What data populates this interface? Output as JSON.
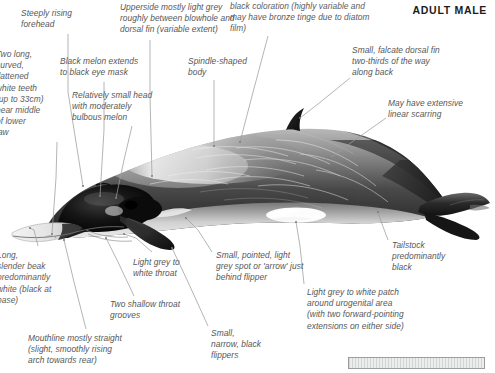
{
  "header": {
    "title": "ADULT MALE"
  },
  "figure": {
    "orientation": "left-facing",
    "colors": {
      "body_dark": "#242424",
      "body_mid": "#6b6b6b",
      "body_light": "#dedede",
      "belly_white": "#fbfbfb",
      "leader_line": "#9a9c9e",
      "text": "#555759",
      "header_text": "#1c1c1c",
      "scalebar_fill": "#eceded",
      "scalebar_border": "#9a9c9e"
    }
  },
  "callouts": [
    {
      "id": "steeply-rising-forehead",
      "text": "Steeply rising\nforehead",
      "x": 21,
      "y": 8,
      "align": "left",
      "clipped": false
    },
    {
      "id": "upperside-light-grey",
      "text": "Upperside mostly light grey\nroughly between blowhole and\ndorsal fin (variable extent)",
      "x": 120,
      "y": 2,
      "align": "left",
      "clipped": false
    },
    {
      "id": "black-coloration-bronze-tinge",
      "text": "black coloration (highly variable and\nmay have bronze tinge due to diatom\nfilm)",
      "x": 230,
      "y": 1,
      "align": "left",
      "clipped": true
    },
    {
      "id": "two-long-curved-teeth",
      "text": "Two long,\ncurved,\nflattened\nwhite teeth\n(up to 33cm)\nnear middle\nof lower\njaw",
      "x": -4,
      "y": 49,
      "align": "left",
      "clipped": true
    },
    {
      "id": "black-melon-extends-eye-mask",
      "text": "Black melon extends\nto black eye mask",
      "x": 60,
      "y": 56,
      "align": "left",
      "clipped": false
    },
    {
      "id": "relatively-small-head",
      "text": "Relatively small head\nwith moderately\nbulbous melon",
      "x": 72,
      "y": 90,
      "align": "left",
      "clipped": false
    },
    {
      "id": "spindle-shaped-body",
      "text": "Spindle-shaped\nbody",
      "x": 188,
      "y": 56,
      "align": "left",
      "clipped": false
    },
    {
      "id": "small-falcate-dorsal-fin",
      "text": "Small, falcate dorsal fin\ntwo-thirds of the way\nalong back",
      "x": 352,
      "y": 45,
      "align": "left",
      "clipped": false
    },
    {
      "id": "may-have-extensive-linear-scarring",
      "text": "May have extensive\nlinear scarring",
      "x": 388,
      "y": 98,
      "align": "left",
      "clipped": false
    },
    {
      "id": "long-slender-beak",
      "text": "Long,\nslender beak\npredominantly\nwhite (black at\nbase)",
      "x": -3,
      "y": 250,
      "align": "left",
      "clipped": true
    },
    {
      "id": "light-grey-to-white-throat",
      "text": "Light grey to\nwhite throat",
      "x": 133,
      "y": 257,
      "align": "left",
      "clipped": false
    },
    {
      "id": "two-shallow-throat-grooves",
      "text": "Two shallow throat\ngrooves",
      "x": 110,
      "y": 299,
      "align": "left",
      "clipped": false
    },
    {
      "id": "mouthline-mostly-straight",
      "text": "Mouthline mostly straight\n(slight, smoothly rising\narch towards rear)",
      "x": 28,
      "y": 333,
      "align": "left",
      "clipped": false
    },
    {
      "id": "small-pointed-light-grey-spot",
      "text": "Small, pointed, light\ngrey spot or 'arrow' just\nbehind flipper",
      "x": 216,
      "y": 250,
      "align": "left",
      "clipped": false
    },
    {
      "id": "small-narrow-black-flippers",
      "text": "Small,\nnarrow, black\nflippers",
      "x": 211,
      "y": 328,
      "align": "left",
      "clipped": false
    },
    {
      "id": "light-grey-to-white-urogenital-patch",
      "text": "Light grey to white patch\naround urogenital area\n(with two forward-pointing\nextensions on either side)",
      "x": 307,
      "y": 287,
      "align": "left",
      "clipped": false
    },
    {
      "id": "tailstock-predominantly-black",
      "text": "Tailstock\npredominantly\nblack",
      "x": 392,
      "y": 240,
      "align": "left",
      "clipped": false
    }
  ],
  "scalebar": {
    "id": "scale-bar",
    "label": ""
  }
}
